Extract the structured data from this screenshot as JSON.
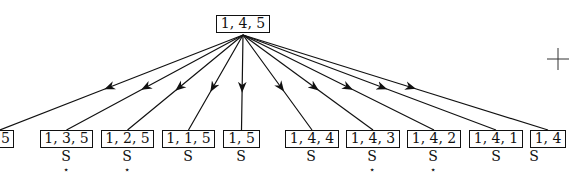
{
  "root": {
    "label": "1, 4, 5",
    "x": 216,
    "y": 15,
    "w": 54
  },
  "origin": {
    "x": 243,
    "y": 35
  },
  "children": [
    {
      "label": "5",
      "x": -38,
      "w": 52,
      "status": "S",
      "starred": false,
      "sx": -5
    },
    {
      "label": "1, 3, 5",
      "x": 40,
      "w": 53,
      "status": "S",
      "starred": true,
      "sx": 66
    },
    {
      "label": "1, 2, 5",
      "x": 101,
      "w": 53,
      "status": "S",
      "starred": true,
      "sx": 127
    },
    {
      "label": "1, 1, 5",
      "x": 162,
      "w": 53,
      "status": "S",
      "starred": false,
      "sx": 188
    },
    {
      "label": "1, 5",
      "x": 223,
      "w": 37,
      "status": "S",
      "starred": false,
      "sx": 241
    },
    {
      "label": "1, 4, 4",
      "x": 285,
      "w": 54,
      "status": "S",
      "starred": false,
      "sx": 311
    },
    {
      "label": "1, 4, 3",
      "x": 346,
      "w": 54,
      "status": "S",
      "starred": true,
      "sx": 372
    },
    {
      "label": "1, 4, 2",
      "x": 407,
      "w": 54,
      "status": "S",
      "starred": true,
      "sx": 433
    },
    {
      "label": "1, 4, 1",
      "x": 469,
      "w": 54,
      "status": "S",
      "starred": false,
      "sx": 496
    },
    {
      "label": "1, 4",
      "x": 530,
      "w": 36,
      "status": "S",
      "starred": false,
      "sx": 534
    }
  ],
  "child_row": {
    "box_y": 130,
    "status_y": 149,
    "star_y": 165
  },
  "crosshair": {
    "x": 558,
    "y": 59,
    "size": 11
  },
  "colors": {
    "ink": "#111111",
    "background": "#ffffff"
  }
}
